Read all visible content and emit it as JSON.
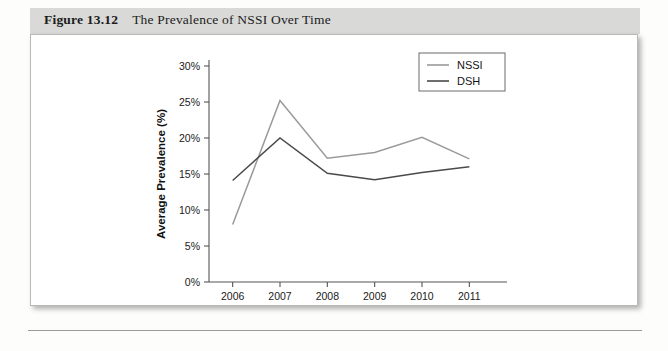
{
  "figure": {
    "number": "Figure 13.12",
    "title": "The Prevalence of NSSI Over Time"
  },
  "chart_data": {
    "type": "line",
    "title": "The Prevalence of NSSI Over Time",
    "xlabel": "Year",
    "ylabel": "Average Prevalence (%)",
    "categories": [
      "2006",
      "2007",
      "2008",
      "2009",
      "2010",
      "2011"
    ],
    "x": [
      2006,
      2007,
      2008,
      2009,
      2010,
      2011
    ],
    "xlim": [
      2005.5,
      2011.5
    ],
    "ylim": [
      0,
      30
    ],
    "ytick_labels": [
      "0%",
      "5%",
      "10%",
      "15%",
      "20%",
      "25%",
      "30%"
    ],
    "ytick_values": [
      0,
      5,
      10,
      15,
      20,
      25,
      30
    ],
    "grid": false,
    "legend_position": "top-right",
    "series": [
      {
        "name": "NSSI",
        "color": "#9a9a9a",
        "values": [
          8,
          25.2,
          17.2,
          18,
          20.1,
          17.1
        ]
      },
      {
        "name": "DSH",
        "color": "#4a4a4a",
        "values": [
          14.1,
          20,
          15.1,
          14.2,
          15.2,
          16
        ]
      }
    ]
  },
  "axes": {
    "y_label": "Average Prevalence (%)",
    "x_label": "Year"
  },
  "legend": {
    "items": [
      {
        "label": "NSSI"
      },
      {
        "label": "DSH"
      }
    ]
  }
}
